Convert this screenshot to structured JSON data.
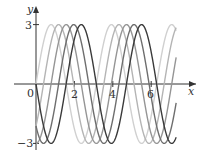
{
  "chart_data": {
    "type": "line",
    "title": "",
    "xlabel": "x",
    "ylabel": "y",
    "xlim": [
      -0.9,
      8.0
    ],
    "ylim": [
      -3.3,
      3.5
    ],
    "x_ticks": [
      "0",
      "2",
      "4",
      "6"
    ],
    "y_ticks": [
      "3",
      "-3"
    ],
    "grid": false,
    "legend": null,
    "series": [
      {
        "name": "y = 3 sin(2x)",
        "amplitude": 3,
        "frequency": 2,
        "phase_shift": 0,
        "color": "#d0d0d0"
      },
      {
        "name": "y = 3 sin(2x - π/4)",
        "amplitude": 3,
        "frequency": 2,
        "phase_shift": 0.785,
        "color": "#b4b4b4"
      },
      {
        "name": "y = 3 sin(2x - π/2)",
        "amplitude": 3,
        "frequency": 2,
        "phase_shift": 1.571,
        "color": "#959595"
      },
      {
        "name": "y = 3 sin(2x - 3π/4)",
        "amplitude": 3,
        "frequency": 2,
        "phase_shift": 2.356,
        "color": "#6e6e6e"
      },
      {
        "name": "y = 3 sin(2x - π)",
        "amplitude": 3,
        "frequency": 2,
        "phase_shift": 3.142,
        "color": "#3a3a3a"
      }
    ],
    "x_range_plotted": [
      0,
      7.3
    ]
  },
  "axes": {
    "x_label": "x",
    "y_label": "y",
    "tick_labels_x": [
      "0",
      "2",
      "4",
      "6"
    ],
    "tick_label_y_top": "3",
    "tick_label_y_bottom": "−3"
  }
}
